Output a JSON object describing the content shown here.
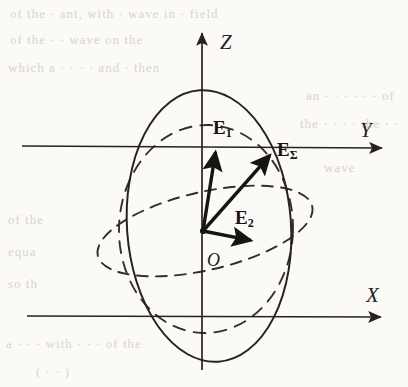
{
  "figure": {
    "kind": "vector-diagram",
    "background_color": "#fbfaf7",
    "ink_color": "#26231f"
  },
  "axes": [
    {
      "id": "z",
      "label": "Z",
      "label_x": 220,
      "label_y": 30,
      "from": [
        202,
        370
      ],
      "to": [
        202,
        33
      ],
      "arrow": true
    },
    {
      "id": "y",
      "label": "Y",
      "label_x": 360,
      "label_y": 118,
      "from": [
        22,
        146
      ],
      "to": [
        382,
        148
      ],
      "arrow": true
    },
    {
      "id": "x",
      "label": "X",
      "label_x": 366,
      "label_y": 283,
      "from": [
        27,
        316
      ],
      "to": [
        381,
        317
      ],
      "arrow": true
    }
  ],
  "origin": {
    "label": "O",
    "label_x": 207,
    "label_y": 250,
    "point_x": 203,
    "point_y": 231
  },
  "vectors": [
    {
      "id": "e1",
      "label": "E",
      "subscript": "1",
      "label_x": 213,
      "label_y": 118,
      "from": [
        203,
        231
      ],
      "to": [
        216,
        149
      ]
    },
    {
      "id": "esum",
      "label": "E",
      "subscript": "Σ",
      "label_x": 277,
      "label_y": 140,
      "from": [
        203,
        231
      ],
      "to": [
        272,
        153
      ]
    },
    {
      "id": "e2",
      "label": "E",
      "subscript": "2",
      "label_x": 235,
      "label_y": 208,
      "from": [
        203,
        231
      ],
      "to": [
        254,
        241
      ]
    }
  ],
  "curves": [
    {
      "id": "polarization-ellipse",
      "style": "solid",
      "cx": 209,
      "cy": 226,
      "rx": 82,
      "ry": 136,
      "rotation": -4
    },
    {
      "id": "projection-circle",
      "style": "dashed",
      "cx": 206,
      "cy": 229,
      "rx": 87,
      "ry": 104,
      "rotation": 2
    },
    {
      "id": "tilted-plane-ellipse",
      "style": "dashed",
      "cx": 205,
      "cy": 231,
      "rx": 110,
      "ry": 39,
      "rotation": -13
    }
  ],
  "bleed_text": [
    {
      "text": "of the  · ant, with ·  wave in  ·  field",
      "x": 10,
      "y": 6
    },
    {
      "text": "of the  · · wave on the",
      "x": 10,
      "y": 32
    },
    {
      "text": "which a  · · · · and  · then",
      "x": 8,
      "y": 60
    },
    {
      "text": "an  · · · · · ·  of",
      "x": 306,
      "y": 88
    },
    {
      "text": "the  · · · · the  · ·",
      "x": 300,
      "y": 116
    },
    {
      "text": "wave",
      "x": 324,
      "y": 160
    },
    {
      "text": "of the",
      "x": 8,
      "y": 212
    },
    {
      "text": "equa",
      "x": 8,
      "y": 244
    },
    {
      "text": "so th",
      "x": 8,
      "y": 276
    },
    {
      "text": "a  · · ·  with  · · ·  of the",
      "x": 6,
      "y": 336
    },
    {
      "text": "(  · · )",
      "x": 36,
      "y": 364
    }
  ]
}
